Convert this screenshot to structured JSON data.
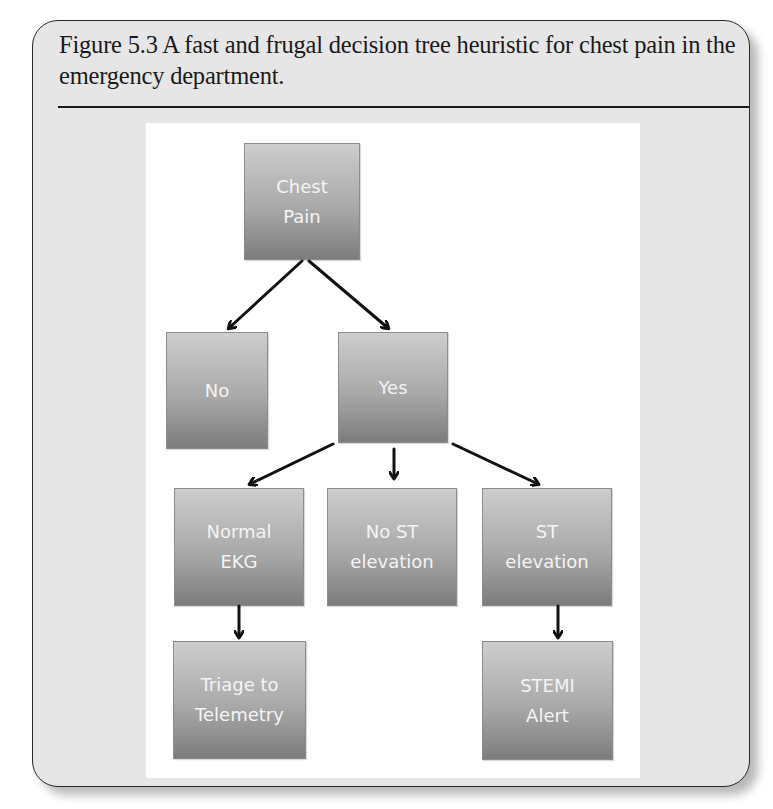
{
  "figure": {
    "caption": "Figure 5.3 A fast and frugal decision tree heuristic for chest pain in the emergency department."
  },
  "diagram": {
    "nodes": [
      {
        "id": "chest-pain",
        "label": "Chest\nPain"
      },
      {
        "id": "no",
        "label": "No"
      },
      {
        "id": "yes",
        "label": "Yes"
      },
      {
        "id": "normal-ekg",
        "label": "Normal\nEKG"
      },
      {
        "id": "no-st-elevation",
        "label": "No ST\nelevation"
      },
      {
        "id": "st-elevation",
        "label": "ST\nelevation"
      },
      {
        "id": "triage-to-telemetry",
        "label": "Triage to\nTelemetry"
      },
      {
        "id": "stemi-alert",
        "label": "STEMI\nAlert"
      }
    ],
    "edges": [
      {
        "from": "chest-pain",
        "to": "no"
      },
      {
        "from": "chest-pain",
        "to": "yes"
      },
      {
        "from": "yes",
        "to": "normal-ekg"
      },
      {
        "from": "yes",
        "to": "no-st-elevation"
      },
      {
        "from": "yes",
        "to": "st-elevation"
      },
      {
        "from": "normal-ekg",
        "to": "triage-to-telemetry"
      },
      {
        "from": "st-elevation",
        "to": "stemi-alert"
      }
    ],
    "colors": {
      "node_top": "#cdcdcd",
      "node_bottom": "#7c7c7c",
      "node_text": "#f4f4f4",
      "arrow": "#111111"
    }
  }
}
